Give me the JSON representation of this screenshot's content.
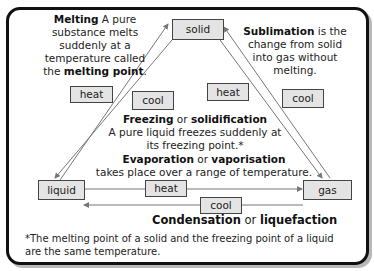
{
  "states": {
    "solid": "solid",
    "liquid": "liquid",
    "gas": "gas"
  },
  "process_labels": {
    "heat_melting": "heat",
    "cool_freezing": "cool",
    "heat_sublimation": "heat",
    "cool_deposition": "cool",
    "heat_evaporation": "heat",
    "cool_condensation": "cool"
  },
  "melting": {
    "term": "Melting",
    "line1": " A pure",
    "line2": "substance melts",
    "line3": "suddenly at a",
    "line4": "temperature called",
    "line5_prefix": "the ",
    "line5_term": "melting point",
    "line5_suffix": "."
  },
  "sublimation": {
    "term": "Sublimation",
    "line1_suffix": " is the",
    "line2": "change from solid",
    "line3": "into gas without",
    "line4": "melting."
  },
  "freezing": {
    "term1": "Freezing",
    "or": " or ",
    "term2": "solidification",
    "line2": "A pure liquid freezes suddenly at",
    "line3": "its freezing point.*"
  },
  "evaporation": {
    "term1": "Evaporation",
    "or": " or ",
    "term2": "vaporisation",
    "line2": "takes place over a range of temperature."
  },
  "condensation": {
    "term1": "Condensation",
    "or": " or ",
    "term2": "liquefaction"
  },
  "footnote": {
    "line1": "*The melting point of a solid and the freezing point of a liquid",
    "line2": "are the same temperature."
  },
  "colors": {
    "box_fill": "#e4e4e4",
    "arrow": "#777777",
    "border": "#111111"
  }
}
